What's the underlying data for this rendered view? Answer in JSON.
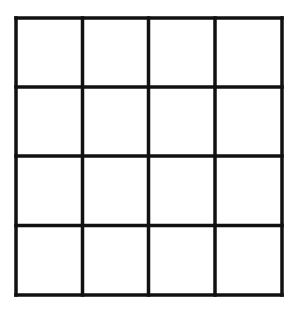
{
  "diagram": {
    "type": "grid",
    "rows": 4,
    "columns": 4,
    "cells": [
      [
        "",
        "",
        "",
        ""
      ],
      [
        "",
        "",
        "",
        ""
      ],
      [
        "",
        "",
        "",
        ""
      ],
      [
        "",
        "",
        "",
        ""
      ]
    ],
    "line_color": "#111111",
    "background_color": "#ffffff",
    "line_width": 3.5,
    "bounds": {
      "left": 16,
      "top": 18,
      "right": 282,
      "bottom": 295
    },
    "vertical_lines_x": [
      16,
      82.5,
      148.5,
      215,
      282
    ],
    "horizontal_lines_y": [
      18,
      87,
      156,
      225.5,
      295
    ]
  }
}
